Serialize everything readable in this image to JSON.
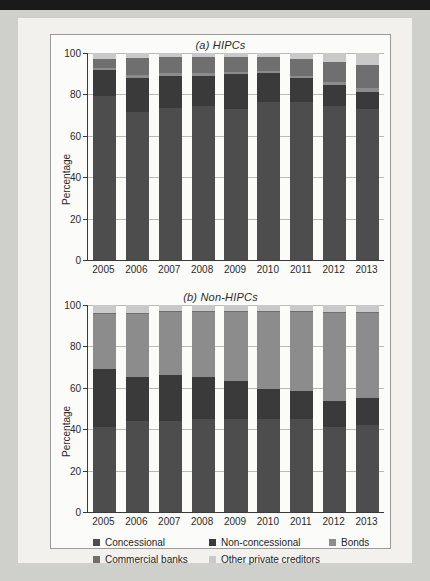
{
  "figure": {
    "ylabel": "Percentage",
    "yticks": [
      0,
      20,
      40,
      60,
      80,
      100
    ],
    "years": [
      "2005",
      "2006",
      "2007",
      "2008",
      "2009",
      "2010",
      "2011",
      "2012",
      "2013"
    ]
  },
  "legend": {
    "items": [
      {
        "label": "Concessional",
        "color": "#4d4d4d"
      },
      {
        "label": "Non-concessional",
        "color": "#3a3a3a"
      },
      {
        "label": "Bonds",
        "color": "#8c8c8c"
      },
      {
        "label": "Commercial banks",
        "color": "#6f6f6f"
      },
      {
        "label": "Other private creditors",
        "color": "#c9c9c9"
      }
    ]
  },
  "chart_data": [
    {
      "type": "bar",
      "stacked": true,
      "title": "(a) HIPCs",
      "xlabel": "",
      "ylabel": "Percentage",
      "ylim": [
        0,
        100
      ],
      "yticks": [
        0,
        20,
        40,
        60,
        80,
        100
      ],
      "grid": true,
      "legend_position": "below-figure",
      "categories": [
        "2005",
        "2006",
        "2007",
        "2008",
        "2009",
        "2010",
        "2011",
        "2012",
        "2013"
      ],
      "series": [
        {
          "name": "Concessional",
          "color": "#4d4d4d",
          "values": [
            79.0,
            71.5,
            73.5,
            74.5,
            73.0,
            76.5,
            76.5,
            74.5,
            73.0
          ]
        },
        {
          "name": "Non-concessional",
          "color": "#3a3a3a",
          "values": [
            13.0,
            16.5,
            15.5,
            14.5,
            17.0,
            14.0,
            11.5,
            10.0,
            8.0
          ]
        },
        {
          "name": "Bonds",
          "color": "#8c8c8c",
          "values": [
            1.0,
            1.5,
            1.5,
            1.5,
            1.0,
            1.0,
            1.0,
            1.5,
            2.0
          ]
        },
        {
          "name": "Commercial banks",
          "color": "#6f6f6f",
          "values": [
            4.0,
            8.0,
            7.5,
            7.5,
            7.0,
            6.5,
            8.0,
            9.5,
            11.0
          ]
        },
        {
          "name": "Other private creditors",
          "color": "#c9c9c9",
          "values": [
            3.0,
            2.5,
            2.0,
            2.0,
            2.0,
            2.0,
            3.0,
            4.5,
            6.0
          ]
        }
      ]
    },
    {
      "type": "bar",
      "stacked": true,
      "title": "(b) Non-HIPCs",
      "xlabel": "",
      "ylabel": "Percentage",
      "ylim": [
        0,
        100
      ],
      "yticks": [
        0,
        20,
        40,
        60,
        80,
        100
      ],
      "grid": true,
      "legend_position": "below-figure",
      "categories": [
        "2005",
        "2006",
        "2007",
        "2008",
        "2009",
        "2010",
        "2011",
        "2012",
        "2013"
      ],
      "series": [
        {
          "name": "Concessional",
          "color": "#4d4d4d",
          "values": [
            41.0,
            44.0,
            44.0,
            45.0,
            45.0,
            45.0,
            45.0,
            41.0,
            42.0
          ]
        },
        {
          "name": "Non-concessional",
          "color": "#3a3a3a",
          "values": [
            28.0,
            21.0,
            22.0,
            20.0,
            18.5,
            14.5,
            13.5,
            12.5,
            13.0
          ]
        },
        {
          "name": "Bonds",
          "color": "#8c8c8c",
          "values": [
            26.5,
            30.5,
            30.5,
            31.5,
            33.0,
            37.0,
            38.0,
            42.5,
            41.0
          ]
        },
        {
          "name": "Commercial banks",
          "color": "#6f6f6f",
          "values": [
            0.5,
            0.5,
            0.5,
            0.5,
            0.5,
            0.5,
            0.5,
            0.5,
            0.5
          ]
        },
        {
          "name": "Other private creditors",
          "color": "#c9c9c9",
          "values": [
            4.0,
            4.0,
            3.0,
            3.0,
            3.0,
            3.0,
            3.0,
            3.5,
            3.5
          ]
        }
      ]
    }
  ]
}
